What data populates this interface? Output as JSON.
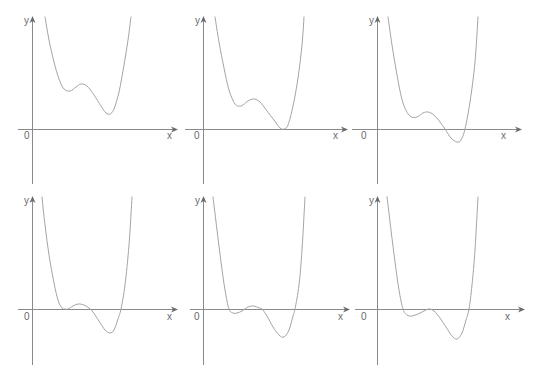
{
  "figure": {
    "width": 542,
    "height": 385,
    "colors": {
      "axis": "#8a8a8a",
      "arrow": "#6a6a6a",
      "curve": "#a4a4a4",
      "label": "#6a6a6a",
      "background": "#ffffff"
    }
  },
  "chart_data": [
    {
      "type": "line",
      "panel": 1,
      "title": "",
      "xlabel": "x",
      "ylabel": "y",
      "origin_label": "0",
      "grid": false,
      "axes": {
        "x_axis": {
          "x1": 18,
          "x2": 178,
          "y": 129
        },
        "y_axis": {
          "x": 32,
          "y1": 16,
          "y2": 184
        }
      },
      "labels": {
        "y": [
          24,
          24
        ],
        "origin": [
          24,
          139
        ],
        "x": [
          167,
          139
        ]
      },
      "description": "Quartic-like curve entirely above x-axis: local min, small local max, lower local min above axis",
      "points": [
        [
          45,
          17
        ],
        [
          49,
          40
        ],
        [
          54,
          62
        ],
        [
          59,
          79
        ],
        [
          64,
          89
        ],
        [
          70,
          91
        ],
        [
          76,
          87
        ],
        [
          81,
          84
        ],
        [
          87,
          86
        ],
        [
          94,
          95
        ],
        [
          101,
          106
        ],
        [
          106,
          113
        ],
        [
          110,
          114
        ],
        [
          114,
          109
        ],
        [
          119,
          92
        ],
        [
          124,
          65
        ],
        [
          128,
          40
        ],
        [
          131,
          17
        ]
      ]
    },
    {
      "type": "line",
      "panel": 2,
      "title": "",
      "xlabel": "x",
      "ylabel": "y",
      "origin_label": "0",
      "grid": false,
      "axes": {
        "x_axis": {
          "x1": 185,
          "x2": 348,
          "y": 129
        },
        "y_axis": {
          "x": 203,
          "y1": 16,
          "y2": 184
        }
      },
      "labels": {
        "y": [
          195,
          24
        ],
        "origin": [
          194,
          139
        ],
        "x": [
          333,
          139
        ]
      },
      "description": "Curve with local min, small local max, and a double root tangent to x-axis",
      "points": [
        [
          215,
          17
        ],
        [
          219,
          42
        ],
        [
          224,
          68
        ],
        [
          229,
          90
        ],
        [
          235,
          104
        ],
        [
          241,
          106
        ],
        [
          248,
          101
        ],
        [
          254,
          99
        ],
        [
          260,
          102
        ],
        [
          267,
          111
        ],
        [
          274,
          120
        ],
        [
          280,
          128
        ],
        [
          284,
          129
        ],
        [
          288,
          125
        ],
        [
          293,
          106
        ],
        [
          298,
          78
        ],
        [
          302,
          45
        ],
        [
          304,
          17
        ]
      ]
    },
    {
      "type": "line",
      "panel": 3,
      "title": "",
      "xlabel": "x",
      "ylabel": "y",
      "origin_label": "0",
      "grid": false,
      "axes": {
        "x_axis": {
          "x1": 352,
          "x2": 522,
          "y": 129
        },
        "y_axis": {
          "x": 377,
          "y1": 16,
          "y2": 184
        }
      },
      "labels": {
        "y": [
          369,
          24
        ],
        "origin": [
          361,
          139
        ],
        "x": [
          501,
          139
        ]
      },
      "description": "Curve with positive local min, local max, then crosses x-axis twice around a negative minimum",
      "points": [
        [
          388,
          17
        ],
        [
          392,
          45
        ],
        [
          397,
          75
        ],
        [
          403,
          103
        ],
        [
          410,
          116
        ],
        [
          417,
          117
        ],
        [
          423,
          113
        ],
        [
          428,
          112
        ],
        [
          434,
          115
        ],
        [
          440,
          122
        ],
        [
          445,
          129
        ],
        [
          451,
          138
        ],
        [
          457,
          142
        ],
        [
          461,
          140
        ],
        [
          465,
          129
        ],
        [
          470,
          102
        ],
        [
          475,
          62
        ],
        [
          478,
          17
        ]
      ]
    },
    {
      "type": "line",
      "panel": 4,
      "title": "",
      "xlabel": "x",
      "ylabel": "y",
      "origin_label": "0",
      "grid": false,
      "axes": {
        "x_axis": {
          "x1": 18,
          "x2": 178,
          "y": 309
        },
        "y_axis": {
          "x": 32,
          "y1": 196,
          "y2": 365
        }
      },
      "labels": {
        "y": [
          24,
          204
        ],
        "origin": [
          24,
          320
        ],
        "x": [
          167,
          320
        ]
      },
      "description": "Curve tangent to x-axis at left, small local max above axis, then negative minimum with two crossings",
      "points": [
        [
          42,
          197
        ],
        [
          45,
          225
        ],
        [
          49,
          255
        ],
        [
          54,
          283
        ],
        [
          58,
          300
        ],
        [
          62,
          308
        ],
        [
          65,
          309
        ],
        [
          68,
          309
        ],
        [
          73,
          306
        ],
        [
          78,
          304
        ],
        [
          84,
          305
        ],
        [
          89,
          308
        ],
        [
          93,
          312
        ],
        [
          99,
          321
        ],
        [
          105,
          330
        ],
        [
          110,
          333
        ],
        [
          114,
          330
        ],
        [
          118,
          319
        ],
        [
          121,
          309
        ],
        [
          125,
          285
        ],
        [
          129,
          245
        ],
        [
          132,
          197
        ]
      ]
    },
    {
      "type": "line",
      "panel": 5,
      "title": "",
      "xlabel": "x",
      "ylabel": "y",
      "origin_label": "0",
      "grid": false,
      "axes": {
        "x_axis": {
          "x1": 190,
          "x2": 350,
          "y": 309
        },
        "y_axis": {
          "x": 203,
          "y1": 196,
          "y2": 365
        }
      },
      "labels": {
        "y": [
          195,
          204
        ],
        "origin": [
          194,
          320
        ],
        "x": [
          338,
          320
        ]
      },
      "description": "Curve with four real roots: small negative min, small positive max, deeper negative min",
      "points": [
        [
          213,
          197
        ],
        [
          217,
          230
        ],
        [
          221,
          262
        ],
        [
          225,
          290
        ],
        [
          229,
          309
        ],
        [
          233,
          313
        ],
        [
          237,
          313
        ],
        [
          242,
          311
        ],
        [
          248,
          307
        ],
        [
          254,
          306
        ],
        [
          259,
          308
        ],
        [
          262,
          309
        ],
        [
          267,
          316
        ],
        [
          273,
          327
        ],
        [
          279,
          335
        ],
        [
          284,
          337
        ],
        [
          289,
          330
        ],
        [
          293,
          316
        ],
        [
          295,
          309
        ],
        [
          299,
          285
        ],
        [
          302,
          250
        ],
        [
          305,
          197
        ]
      ]
    },
    {
      "type": "line",
      "panel": 6,
      "title": "",
      "xlabel": "x",
      "ylabel": "y",
      "origin_label": "0",
      "grid": false,
      "axes": {
        "x_axis": {
          "x1": 355,
          "x2": 525,
          "y": 309
        },
        "y_axis": {
          "x": 377,
          "y1": 196,
          "y2": 365
        }
      },
      "labels": {
        "y": [
          369,
          204
        ],
        "origin": [
          361,
          320
        ],
        "x": [
          505,
          320
        ]
      },
      "description": "Curve crosses axis, negative local min, local max tangent to x-axis, deeper negative min, then crosses again",
      "points": [
        [
          387,
          197
        ],
        [
          391,
          230
        ],
        [
          395,
          262
        ],
        [
          399,
          290
        ],
        [
          403,
          309
        ],
        [
          407,
          315
        ],
        [
          412,
          316
        ],
        [
          418,
          314
        ],
        [
          424,
          311
        ],
        [
          429,
          309
        ],
        [
          434,
          311
        ],
        [
          440,
          318
        ],
        [
          446,
          327
        ],
        [
          452,
          336
        ],
        [
          457,
          339
        ],
        [
          462,
          333
        ],
        [
          466,
          320
        ],
        [
          469,
          309
        ],
        [
          472,
          285
        ],
        [
          475,
          250
        ],
        [
          478,
          197
        ]
      ]
    }
  ]
}
